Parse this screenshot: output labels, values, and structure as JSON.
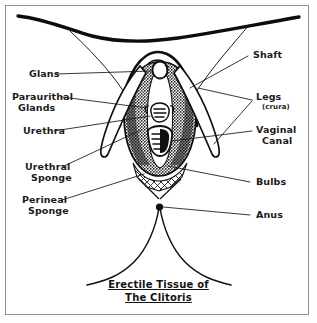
{
  "figure": {
    "title": "Erectile Tissue of The Clitoris",
    "caption_line1": "Erectile Tissue of",
    "caption_line2": "The Clitoris",
    "style": "hand-drawn black ink line diagram on white paper",
    "ink_color": "#111111",
    "paper_color": "#ffffff",
    "frame_color": "#8f9193"
  },
  "labels_left": [
    {
      "id": "glans",
      "text": "Glans",
      "line2": ""
    },
    {
      "id": "paraurithal",
      "text": "Paraurithal",
      "line2": "Glands"
    },
    {
      "id": "urethra",
      "text": "Urethra",
      "line2": ""
    },
    {
      "id": "urethral-sponge",
      "text": "Urethral",
      "line2": "Sponge"
    },
    {
      "id": "perineal-sponge",
      "text": "Perineal",
      "line2": "Sponge"
    }
  ],
  "labels_right": [
    {
      "id": "shaft",
      "text": "Shaft",
      "line2": "",
      "sub": ""
    },
    {
      "id": "legs",
      "text": "Legs",
      "line2": "",
      "sub": "(crura)"
    },
    {
      "id": "vaginal-canal",
      "text": "Vaginal",
      "line2": "Canal",
      "sub": ""
    },
    {
      "id": "bulbs",
      "text": "Bulbs",
      "line2": "",
      "sub": ""
    },
    {
      "id": "anus",
      "text": "Anus",
      "line2": "",
      "sub": ""
    }
  ],
  "anatomy_parts": [
    "glans",
    "shaft",
    "legs (crura)",
    "bulbs",
    "urethra",
    "urethral sponge",
    "paraurithal glands",
    "vaginal canal",
    "perineal sponge",
    "anus"
  ]
}
